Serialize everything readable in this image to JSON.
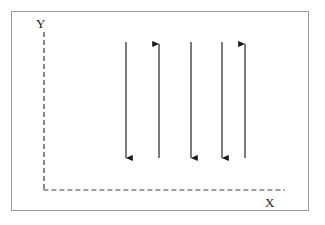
{
  "figure": {
    "type": "vector-field-diagram",
    "background_color": "#ffffff",
    "frame_color": "#9a9a9a",
    "stroke_color": "#1a1a1a"
  },
  "axes": {
    "y_label": "Y",
    "x_label": "X",
    "style": "dashed",
    "origin": {
      "x": 44,
      "y": 190
    },
    "vertical_axis": {
      "x": 44,
      "y_top": 32,
      "y_bottom": 190
    },
    "horizontal_axis": {
      "y": 190,
      "x_left": 44,
      "x_right": 285
    },
    "dash_pattern": "5,3",
    "tick_labels": []
  },
  "chart_data": {
    "type": "scatter",
    "title": "",
    "xlabel": "X",
    "ylabel": "Y",
    "grid": false,
    "legend": null,
    "annotations": [],
    "arrows": [
      {
        "id": "arrow-1",
        "x": 126,
        "tail_y": 42,
        "head_y": 162,
        "direction": "down",
        "length": 120
      },
      {
        "id": "arrow-2",
        "x": 159,
        "tail_y": 158,
        "head_y": 40,
        "direction": "up",
        "length": 118
      },
      {
        "id": "arrow-3",
        "x": 191,
        "tail_y": 42,
        "head_y": 162,
        "direction": "down",
        "length": 120
      },
      {
        "id": "arrow-4",
        "x": 222,
        "tail_y": 42,
        "head_y": 162,
        "direction": "down",
        "length": 120
      },
      {
        "id": "arrow-5",
        "x": 245,
        "tail_y": 158,
        "head_y": 40,
        "direction": "up",
        "length": 118
      }
    ],
    "arrow_count": 5,
    "directions": [
      "down",
      "up",
      "down",
      "down",
      "up"
    ]
  }
}
